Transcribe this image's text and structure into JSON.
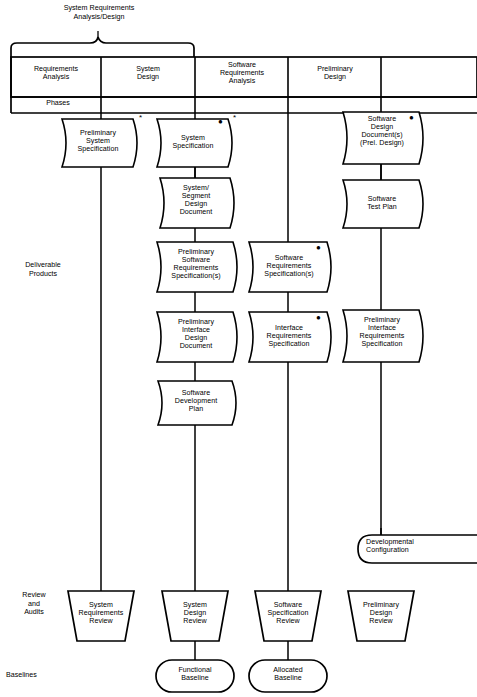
{
  "diagram": {
    "brace_label": "System Requirements\nAnalysis/Design",
    "row_labels": [
      {
        "id": "phases",
        "text": "Phases"
      },
      {
        "id": "deliverable-products",
        "text": "Deliverable\nProducts"
      },
      {
        "id": "review-and-audits",
        "text": "Review\nand\nAudits"
      },
      {
        "id": "baselines",
        "text": "Baselines"
      }
    ],
    "phases": [
      {
        "id": "requirements-analysis",
        "label": "Requirements\nAnalysis"
      },
      {
        "id": "system-design",
        "label": "System\nDesign"
      },
      {
        "id": "software-requirements-analysis",
        "label": "Software\nRequirements\nAnalysis"
      },
      {
        "id": "preliminary-design",
        "label": "Preliminary\nDesign"
      },
      {
        "id": "next-phase",
        "label": ""
      }
    ],
    "documents": [
      {
        "id": "preliminary-system-specification",
        "column": 1,
        "label": "Preliminary\nSystem\nSpecification",
        "dot": false,
        "asterisk": true
      },
      {
        "id": "system-specification",
        "column": 2,
        "label": "System\nSpecification",
        "dot": true,
        "asterisk": true
      },
      {
        "id": "system-segment-design-document",
        "column": 2,
        "label": "System/\nSegment\nDesign\nDocument",
        "dot": false,
        "asterisk": false
      },
      {
        "id": "preliminary-software-requirements-specifications",
        "column": 2,
        "label": "Preliminary\nSoftware\nRequirements\nSpecification(s)",
        "dot": false,
        "asterisk": false
      },
      {
        "id": "preliminary-interface-design-document",
        "column": 2,
        "label": "Preliminary\nInterface\nDesign\nDocument",
        "dot": false,
        "asterisk": false
      },
      {
        "id": "software-development-plan",
        "column": 2,
        "label": "Software\nDevelopment\nPlan",
        "dot": false,
        "asterisk": false
      },
      {
        "id": "software-requirements-specifications",
        "column": 3,
        "label": "Software\nRequirements\nSpecification(s)",
        "dot": true,
        "asterisk": false
      },
      {
        "id": "interface-requirements-specification",
        "column": 3,
        "label": "Interface\nRequirements\nSpecification",
        "dot": true,
        "asterisk": false
      },
      {
        "id": "software-design-documents-prel-design",
        "column": 4,
        "label": "Software\nDesign\nDocument(s)\n(Prel. Design)",
        "dot": true,
        "asterisk": false
      },
      {
        "id": "software-test-plan",
        "column": 4,
        "label": "Software\nTest Plan",
        "dot": false,
        "asterisk": false
      },
      {
        "id": "preliminary-interface-requirements-specification",
        "column": 4,
        "label": "Preliminary\nInterface\nRequirements\nSpecification",
        "dot": false,
        "asterisk": false
      }
    ],
    "configuration": {
      "id": "developmental-configuration",
      "label": "Developmental\nConfiguration"
    },
    "reviews": [
      {
        "id": "system-requirements-review",
        "column": 1,
        "label": "System\nRequirements\nReview"
      },
      {
        "id": "system-design-review",
        "column": 2,
        "label": "System\nDesign\nReview"
      },
      {
        "id": "software-specification-review",
        "column": 3,
        "label": "Software\nSpecification\nReview"
      },
      {
        "id": "preliminary-design-review",
        "column": 4,
        "label": "Preliminary\nDesign\nReview"
      }
    ],
    "baselines": [
      {
        "id": "functional-baseline",
        "column": 2,
        "label": "Functional\nBaseline"
      },
      {
        "id": "allocated-baseline",
        "column": 3,
        "label": "Allocated\nBaseline"
      }
    ],
    "colors": {
      "stroke": "#000000",
      "fill": "#ffffff",
      "background": "#ffffff"
    }
  }
}
